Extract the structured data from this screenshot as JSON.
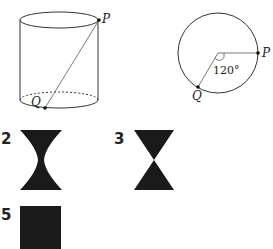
{
  "figure_cylinder": {
    "point_top_label": "P",
    "point_bottom_label": "Q"
  },
  "figure_circle": {
    "point_right_label": "P",
    "point_bottom_label": "Q",
    "angle_label": "120°"
  },
  "options": [
    {
      "number": "2",
      "shape": "hourglass-curved"
    },
    {
      "number": "3",
      "shape": "hourglass-triangles"
    },
    {
      "number": "5",
      "shape": "rectangle"
    }
  ],
  "colors": {
    "line": "#333333",
    "fill": "#1a1a1a",
    "background": "#ffffff"
  }
}
